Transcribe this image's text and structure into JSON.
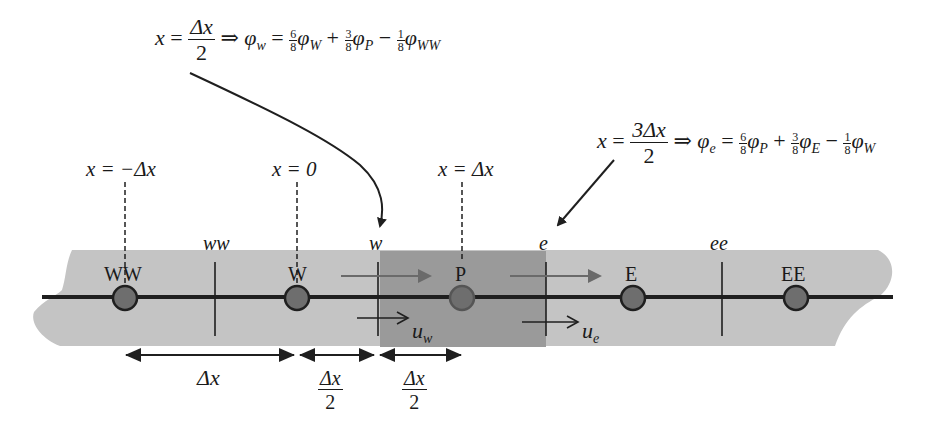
{
  "colors": {
    "band": "#c4c4c4",
    "control_volume": "#9a9a9a",
    "node_fill": "#6e6e6e",
    "line": "#1f1f1f",
    "gray_arrow": "#6a6a6a",
    "text": "#1a1a1a"
  },
  "equations": {
    "west": {
      "lhs_var": "x",
      "eq": "=",
      "frac_num": "Δx",
      "frac_den": "2",
      "implies": "⇒",
      "phi": "φ",
      "phi_sub": "w",
      "terms": [
        {
          "coef_num": "6",
          "coef_den": "8",
          "phi": "φ",
          "sub": "W",
          "op": "="
        },
        {
          "coef_num": "3",
          "coef_den": "8",
          "phi": "φ",
          "sub": "P",
          "op": "+"
        },
        {
          "coef_num": "1",
          "coef_den": "8",
          "phi": "φ",
          "sub": "WW",
          "op": "−"
        }
      ]
    },
    "east": {
      "lhs_var": "x",
      "eq": "=",
      "frac_num": "3Δx",
      "frac_den": "2",
      "implies": "⇒",
      "phi": "φ",
      "phi_sub": "e",
      "terms": [
        {
          "coef_num": "6",
          "coef_den": "8",
          "phi": "φ",
          "sub": "P",
          "op": "="
        },
        {
          "coef_num": "3",
          "coef_den": "8",
          "phi": "φ",
          "sub": "E",
          "op": "+"
        },
        {
          "coef_num": "1",
          "coef_den": "8",
          "phi": "φ",
          "sub": "W",
          "op": "−"
        }
      ]
    }
  },
  "positions": [
    {
      "label": "x = −Δx"
    },
    {
      "label": "x = 0"
    },
    {
      "label": "x = Δx"
    }
  ],
  "nodes": [
    {
      "label": "WW",
      "x": 125
    },
    {
      "label": "W",
      "x": 297
    },
    {
      "label": "P",
      "x": 462
    },
    {
      "label": "E",
      "x": 633
    },
    {
      "label": "EE",
      "x": 796
    }
  ],
  "faces": [
    {
      "label": "ww",
      "x": 215
    },
    {
      "label": "w",
      "x": 378
    },
    {
      "label": "e",
      "x": 546
    },
    {
      "label": "ee",
      "x": 722
    }
  ],
  "velocities": [
    {
      "symbol": "u",
      "sub": "w"
    },
    {
      "symbol": "u",
      "sub": "e"
    }
  ],
  "spacings": [
    {
      "label": "Δx"
    },
    {
      "num": "Δx",
      "den": "2"
    },
    {
      "num": "Δx",
      "den": "2"
    }
  ]
}
